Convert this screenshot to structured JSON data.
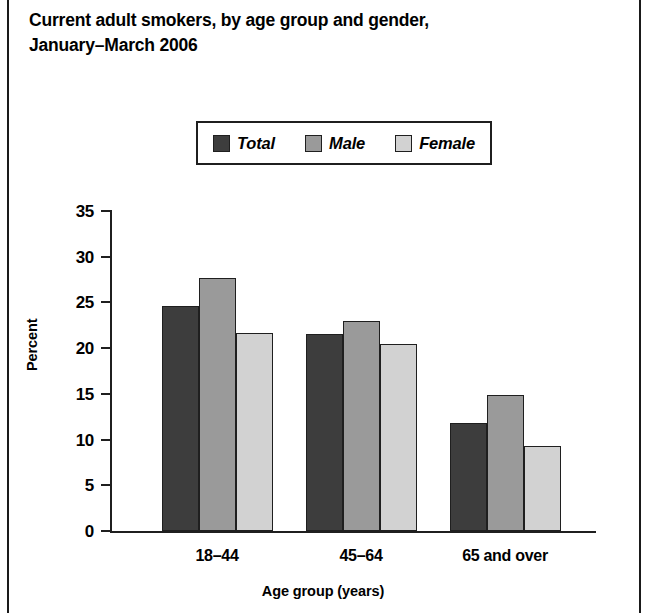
{
  "figure": {
    "title_line1": "Current adult smokers, by age group and gender,",
    "title_line2": "January–March 2006"
  },
  "legend": {
    "items": [
      {
        "label": "Total",
        "color": "#3d3d3d"
      },
      {
        "label": "Male",
        "color": "#9a9a9a"
      },
      {
        "label": "Female",
        "color": "#d2d2d2"
      }
    ]
  },
  "axes": {
    "y_ticks": [
      "35",
      "30",
      "25",
      "20",
      "15",
      "10",
      "5",
      "0"
    ],
    "ylabel": "Percent",
    "xlabel": "Age group (years)",
    "x_ticks": [
      "18–44",
      "45–64",
      "65 and over"
    ]
  },
  "chart_data": {
    "type": "bar",
    "title": "Current adult smokers, by age group and gender, January–March 2006",
    "xlabel": "Age group (years)",
    "ylabel": "Percent",
    "ylim": [
      0,
      35
    ],
    "ytick_values": [
      0,
      5,
      10,
      15,
      20,
      25,
      30,
      35
    ],
    "grid": false,
    "legend_position": "top-center",
    "categories": [
      "18–44",
      "45–64",
      "65 and over"
    ],
    "series": [
      {
        "name": "Total",
        "color": "#3d3d3d",
        "values": [
          24.6,
          21.6,
          11.8
        ]
      },
      {
        "name": "Male",
        "color": "#9a9a9a",
        "values": [
          27.7,
          23.0,
          14.9
        ]
      },
      {
        "name": "Female",
        "color": "#d2d2d2",
        "values": [
          21.7,
          20.5,
          9.3
        ]
      }
    ]
  }
}
